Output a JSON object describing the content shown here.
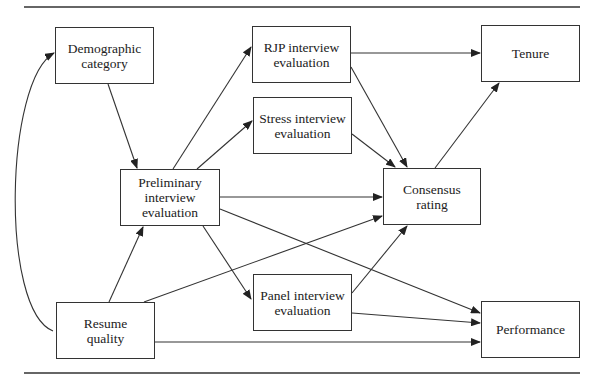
{
  "diagram": {
    "type": "path-diagram",
    "nodes": [
      {
        "id": "demographic",
        "label": "Demographic\ncategory",
        "x": 55,
        "y": 27,
        "w": 99,
        "h": 57
      },
      {
        "id": "rjp",
        "label": "RJP interview\nevaluation",
        "x": 252,
        "y": 26,
        "w": 99,
        "h": 57
      },
      {
        "id": "tenure",
        "label": "Tenure",
        "x": 481,
        "y": 25,
        "w": 99,
        "h": 57
      },
      {
        "id": "stress",
        "label": "Stress interview\nevaluation",
        "x": 253,
        "y": 97,
        "w": 99,
        "h": 57
      },
      {
        "id": "preliminary",
        "label": "Preliminary\ninterview\nevaluation",
        "x": 120,
        "y": 169,
        "w": 100,
        "h": 57
      },
      {
        "id": "consensus",
        "label": "Consensus\nrating",
        "x": 383,
        "y": 168,
        "w": 98,
        "h": 57
      },
      {
        "id": "panel",
        "label": "Panel interview\nevaluation",
        "x": 253,
        "y": 274,
        "w": 99,
        "h": 57
      },
      {
        "id": "resume",
        "label": "Resume\nquality",
        "x": 56,
        "y": 302,
        "w": 99,
        "h": 57
      },
      {
        "id": "performance",
        "label": "Performance",
        "x": 481,
        "y": 301,
        "w": 99,
        "h": 57
      }
    ],
    "edges": [
      {
        "from": "demographic",
        "to": "preliminary"
      },
      {
        "from": "resume",
        "to": "demographic",
        "curved": true
      },
      {
        "from": "resume",
        "to": "preliminary"
      },
      {
        "from": "resume",
        "to": "consensus"
      },
      {
        "from": "resume",
        "to": "performance"
      },
      {
        "from": "preliminary",
        "to": "rjp"
      },
      {
        "from": "preliminary",
        "to": "stress"
      },
      {
        "from": "preliminary",
        "to": "consensus"
      },
      {
        "from": "preliminary",
        "to": "panel"
      },
      {
        "from": "preliminary",
        "to": "performance"
      },
      {
        "from": "rjp",
        "to": "tenure"
      },
      {
        "from": "rjp",
        "to": "consensus"
      },
      {
        "from": "stress",
        "to": "consensus"
      },
      {
        "from": "panel",
        "to": "consensus"
      },
      {
        "from": "panel",
        "to": "performance"
      },
      {
        "from": "consensus",
        "to": "tenure"
      }
    ]
  }
}
